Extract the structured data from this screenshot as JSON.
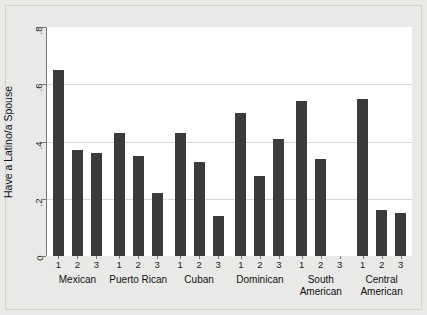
{
  "chart_data": {
    "type": "bar",
    "title": "",
    "xlabel": "",
    "ylabel": "Have a Latino/a Spouse",
    "ylim": [
      0,
      0.8
    ],
    "ytick_labels": [
      "0",
      ".2",
      ".4",
      ".6",
      ".8"
    ],
    "ytick_values": [
      0,
      0.2,
      0.4,
      0.6,
      0.8
    ],
    "grid": "horizontal",
    "legend": "none",
    "bar_color": "#3b3b3b",
    "plot_background": "#ffffff",
    "figure_background": "#e9e9e7",
    "within_group_tick_labels": [
      "1",
      "2",
      "3"
    ],
    "groups": [
      {
        "label": "Mexican",
        "label_line2": "",
        "bars": [
          {
            "tick": "1",
            "value": 0.65
          },
          {
            "tick": "2",
            "value": 0.37
          },
          {
            "tick": "3",
            "value": 0.36
          }
        ]
      },
      {
        "label": "Puerto Rican",
        "label_line2": "",
        "bars": [
          {
            "tick": "1",
            "value": 0.43
          },
          {
            "tick": "2",
            "value": 0.35
          },
          {
            "tick": "3",
            "value": 0.22
          }
        ]
      },
      {
        "label": "Cuban",
        "label_line2": "",
        "bars": [
          {
            "tick": "1",
            "value": 0.43
          },
          {
            "tick": "2",
            "value": 0.33
          },
          {
            "tick": "3",
            "value": 0.14
          }
        ]
      },
      {
        "label": "Dominican",
        "label_line2": "",
        "bars": [
          {
            "tick": "1",
            "value": 0.5
          },
          {
            "tick": "2",
            "value": 0.28
          },
          {
            "tick": "3",
            "value": 0.41
          }
        ]
      },
      {
        "label": "South",
        "label_line2": "American",
        "bars": [
          {
            "tick": "1",
            "value": 0.54
          },
          {
            "tick": "2",
            "value": 0.34
          },
          {
            "tick": "3",
            "value": 0.0
          }
        ]
      },
      {
        "label": "Central",
        "label_line2": "American",
        "bars": [
          {
            "tick": "1",
            "value": 0.55
          },
          {
            "tick": "2",
            "value": 0.16
          },
          {
            "tick": "3",
            "value": 0.15
          }
        ]
      }
    ]
  }
}
